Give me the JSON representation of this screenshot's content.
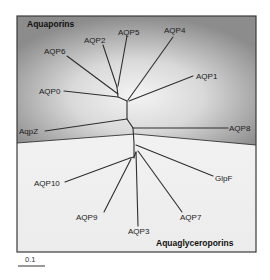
{
  "diagram": {
    "type": "unrooted phylogenetic tree",
    "groups": [
      {
        "name": "Aquaporins",
        "region": "upper",
        "shade": "gray"
      },
      {
        "name": "Aquaglyceroporins",
        "region": "lower",
        "shade": "light"
      }
    ],
    "leaves": {
      "aquaporins": [
        "AQP2",
        "AQP5",
        "AQP4",
        "AQP6",
        "AQP1",
        "AQP0",
        "AqpZ",
        "AQP8"
      ],
      "aquaglyceroporins": [
        "AQP10",
        "GlpF",
        "AQP9",
        "AQP3",
        "AQP7"
      ]
    },
    "labels": {
      "group_upper": "Aquaporins",
      "group_lower": "Aquaglyceroporins",
      "aqp2": "AQP2",
      "aqp5": "AQP5",
      "aqp4": "AQP4",
      "aqp6": "AQP6",
      "aqp1": "AQP1",
      "aqp0": "AQP0",
      "aqpz": "AqpZ",
      "aqp8": "AQP8",
      "aqp10": "AQP10",
      "glpf": "GlpF",
      "aqp9": "AQP9",
      "aqp3": "AQP3",
      "aqp7": "AQP7"
    },
    "scale_bar": {
      "label": "0.1"
    },
    "colors": {
      "upper_region_edge": "#8a8a8a",
      "upper_region_center": "#f2f2f2",
      "lower_region": "#f4f4f4",
      "branch": "#2e2e2e",
      "frame": "#3a3a3a"
    }
  }
}
